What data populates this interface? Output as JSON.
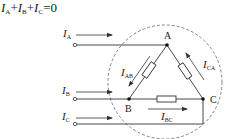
{
  "equation": {
    "terms": [
      {
        "symbol": "I",
        "subscript": "A"
      },
      {
        "symbol": "I",
        "subscript": "B"
      },
      {
        "symbol": "I",
        "subscript": "C"
      }
    ],
    "op1": "+",
    "op2": "+",
    "rhs": "=0"
  },
  "diagram": {
    "type": "delta-connected three-phase load",
    "nodes": {
      "A": "A",
      "B": "B",
      "C": "C"
    },
    "line_currents": {
      "IA": {
        "symbol": "I",
        "subscript": "A"
      },
      "IB": {
        "symbol": "I",
        "subscript": "B"
      },
      "IC": {
        "symbol": "I",
        "subscript": "C"
      }
    },
    "phase_currents": {
      "IAB": {
        "symbol": "I",
        "subscript": "AB"
      },
      "IBC": {
        "symbol": "I",
        "subscript": "BC"
      },
      "ICA": {
        "symbol": "I",
        "subscript": "CA"
      }
    },
    "boundary": "dashed circle (closed surface)",
    "colors": {
      "stroke": "#333333",
      "dashed": "#666666"
    }
  }
}
